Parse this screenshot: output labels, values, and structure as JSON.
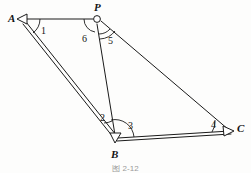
{
  "figure": {
    "caption": "图 2-12",
    "background_color": "#fdfdfc",
    "stroke_color": "#1a1a1a",
    "vertices": [
      {
        "id": "A",
        "label": "A",
        "x": 22,
        "y": 19,
        "marker": "triangle",
        "label_x": 8,
        "label_y": 15
      },
      {
        "id": "P",
        "label": "P",
        "x": 97,
        "y": 19,
        "marker": "circle",
        "label_x": 95,
        "label_y": 3
      },
      {
        "id": "B",
        "label": "B",
        "x": 115,
        "y": 139,
        "marker": "triangle",
        "label_x": 112,
        "label_y": 150
      },
      {
        "id": "C",
        "label": "C",
        "x": 231,
        "y": 131,
        "marker": "triangle",
        "label_x": 237,
        "label_y": 124
      }
    ],
    "segments": [
      {
        "id": "AP",
        "from": "A",
        "to": "P",
        "style": "single"
      },
      {
        "id": "AB",
        "from": "A",
        "to": "B",
        "style": "double"
      },
      {
        "id": "PB",
        "from": "P",
        "to": "B",
        "style": "single"
      },
      {
        "id": "PC",
        "from": "P",
        "to": "C",
        "style": "single"
      },
      {
        "id": "BC",
        "from": "B",
        "to": "C",
        "style": "double"
      }
    ],
    "angles": [
      {
        "id": "1",
        "label": "1",
        "at": "A",
        "label_x": 41,
        "label_y": 27
      },
      {
        "id": "2",
        "label": "2",
        "at": "B",
        "label_x": 100,
        "label_y": 115
      },
      {
        "id": "3",
        "label": "3",
        "at": "B",
        "label_x": 127,
        "label_y": 122
      },
      {
        "id": "4",
        "label": "4",
        "at": "C",
        "label_x": 211,
        "label_y": 121
      },
      {
        "id": "5",
        "label": "5",
        "at": "P",
        "label_x": 108,
        "label_y": 37
      },
      {
        "id": "6",
        "label": "6",
        "at": "P",
        "label_x": 82,
        "label_y": 35
      }
    ]
  }
}
